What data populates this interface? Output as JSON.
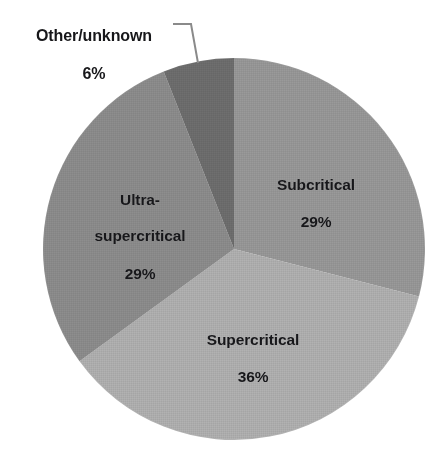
{
  "chart_data": {
    "type": "pie",
    "title": "",
    "subtitle": "",
    "xlabel": "",
    "ylabel": "",
    "legend_position": "none",
    "grid": false,
    "labels_inside": true,
    "unit": "%",
    "categories": [
      "Subcritical",
      "Supercritical",
      "Ultra-supercritical",
      "Other/unknown"
    ],
    "values": [
      29,
      36,
      29,
      6
    ],
    "slices": [
      {
        "label": "Subcritical",
        "value": 29,
        "value_text": "29%",
        "color": "#9a9a9a",
        "start_angle_deg": 0,
        "sweep_deg": 104.4,
        "label_placement": "inside"
      },
      {
        "label": "Supercritical",
        "value": 36,
        "value_text": "36%",
        "color": "#b2b2b2",
        "start_angle_deg": 104.4,
        "sweep_deg": 129.6,
        "label_placement": "inside"
      },
      {
        "label": "Ultra-supercritical",
        "value": 29,
        "value_text": "29%",
        "color": "#8e8e8e",
        "start_angle_deg": 234.0,
        "sweep_deg": 104.4,
        "label_placement": "inside",
        "label_line1": "Ultra-",
        "label_line2": "supercritical"
      },
      {
        "label": "Other/unknown",
        "value": 6,
        "value_text": "6%",
        "color": "#6f6f6f",
        "start_angle_deg": 338.4,
        "sweep_deg": 21.6,
        "label_placement": "outside-leader"
      }
    ],
    "geometry": {
      "center_x": 234,
      "center_y": 249,
      "radius": 191
    },
    "colors": {
      "background": "#ffffff",
      "text": "#17171a",
      "leader_line": "#808080"
    }
  }
}
